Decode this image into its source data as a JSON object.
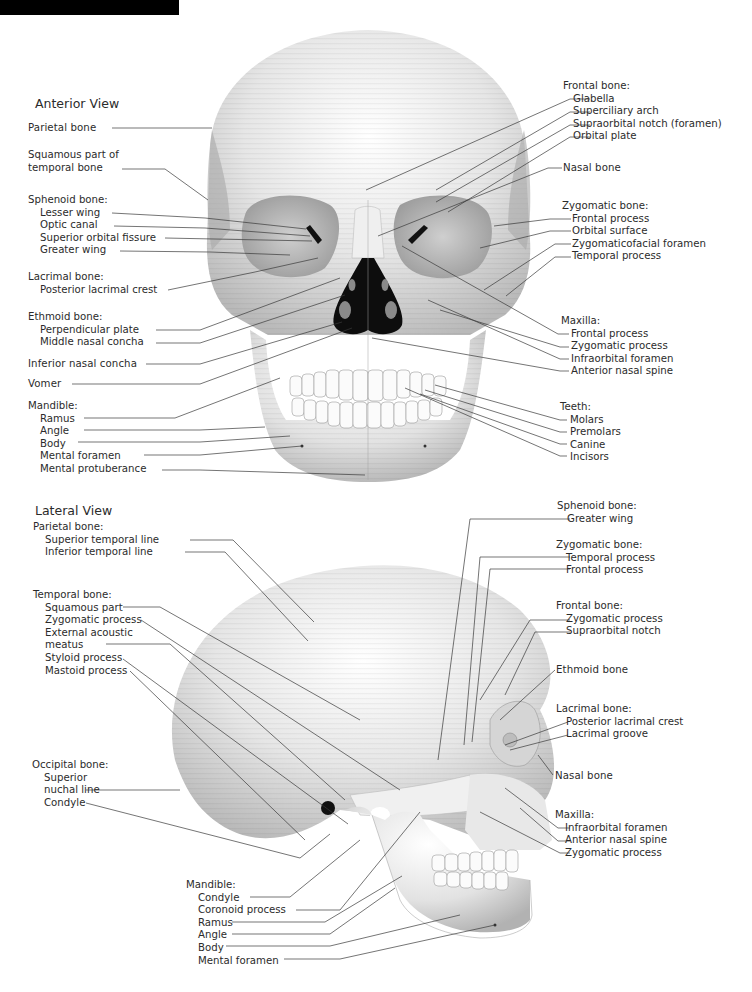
{
  "header_bar": {
    "color": "#000000"
  },
  "anterior": {
    "title": "Anterior View",
    "left": {
      "parietal": "Parietal bone",
      "squamous": [
        "Squamous part of",
        "temporal bone"
      ],
      "sphenoid": {
        "title": "Sphenoid bone:",
        "items": [
          "Lesser wing",
          "Optic canal",
          "Superior orbital fissure",
          "Greater wing"
        ]
      },
      "lacrimal": {
        "title": "Lacrimal bone:",
        "items": [
          "Posterior lacrimal crest"
        ]
      },
      "ethmoid": {
        "title": "Ethmoid bone:",
        "items": [
          "Perpendicular plate",
          "Middle nasal concha"
        ]
      },
      "inferior_nasal_concha": "Inferior nasal concha",
      "vomer": "Vomer",
      "mandible": {
        "title": "Mandible:",
        "items": [
          "Ramus",
          "Angle",
          "Body",
          "Mental foramen",
          "Mental protuberance"
        ]
      }
    },
    "right": {
      "frontal": {
        "title": "Frontal bone:",
        "items": [
          "Glabella",
          "Superciliary arch",
          "Supraorbital notch (foramen)",
          "Orbital plate"
        ]
      },
      "nasal": "Nasal bone",
      "zygomatic": {
        "title": "Zygomatic bone:",
        "items": [
          "Frontal process",
          "Orbital surface",
          "Zygomaticofacial foramen",
          "Temporal process"
        ]
      },
      "maxilla": {
        "title": "Maxilla:",
        "items": [
          "Frontal process",
          "Zygomatic process",
          "Infraorbital foramen",
          "Anterior nasal spine"
        ]
      },
      "teeth": {
        "title": "Teeth:",
        "items": [
          "Molars",
          "Premolars",
          "Canine",
          "Incisors"
        ]
      }
    }
  },
  "lateral": {
    "title": "Lateral View",
    "left": {
      "parietal": {
        "title": "Parietal bone:",
        "items": [
          "Superior temporal line",
          "Inferior temporal line"
        ]
      },
      "temporal": {
        "title": "Temporal bone:",
        "items": [
          "Squamous part",
          "Zygomatic process",
          "External acoustic",
          "meatus",
          "Styloid process",
          "Mastoid process"
        ]
      },
      "occipital": {
        "title": "Occipital bone:",
        "items": [
          "Superior",
          "nuchal line",
          "Condyle"
        ]
      },
      "mandible": {
        "title": "Mandible:",
        "items": [
          "Condyle",
          "Coronoid process",
          "Ramus",
          "Angle",
          "Body",
          "Mental foramen"
        ]
      }
    },
    "right": {
      "sphenoid": {
        "title": "Sphenoid bone:",
        "items": [
          "Greater wing"
        ]
      },
      "zygomatic": {
        "title": "Zygomatic bone:",
        "items": [
          "Temporal process",
          "Frontal process"
        ]
      },
      "frontal": {
        "title": "Frontal bone:",
        "items": [
          "Zygomatic process",
          "Supraorbital notch"
        ]
      },
      "ethmoid": "Ethmoid bone",
      "lacrimal": {
        "title": "Lacrimal bone:",
        "items": [
          "Posterior lacrimal crest",
          "Lacrimal groove"
        ]
      },
      "nasal": "Nasal bone",
      "maxilla": {
        "title": "Maxilla:",
        "items": [
          "Infraorbital foramen",
          "Anterior nasal spine",
          "Zygomatic process"
        ]
      }
    }
  }
}
